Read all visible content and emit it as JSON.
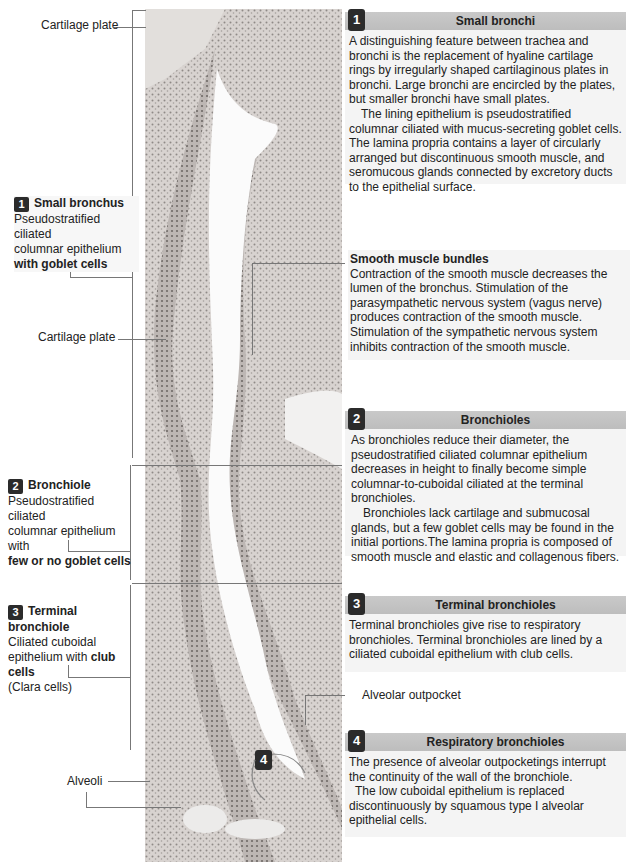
{
  "figure": {
    "left_labels": {
      "cartilage_plate_top": "Cartilage plate",
      "small_bronchus": {
        "number": "1",
        "title": "Small bronchus",
        "line1": "Pseudostratified ciliated",
        "line2": "columnar epithelium",
        "line3_bold": "with goblet cells"
      },
      "cartilage_plate_mid": "Cartilage plate",
      "bronchiole": {
        "number": "2",
        "title": "Bronchiole",
        "line1": "Pseudostratified ciliated",
        "line2": "columnar epithelium with",
        "line3_bold": "few or no goblet cells"
      },
      "terminal_bronchiole": {
        "number": "3",
        "title": "Terminal bronchiole",
        "line1": "Ciliated cuboidal",
        "line2_pre": "epithelium with ",
        "line2_bold": "club cells",
        "line3": "(Clara cells)"
      },
      "alveoli": "Alveoli"
    },
    "micrograph_badge": "4",
    "alveolar_outpocket_label": "Alveolar outpocket",
    "panels": [
      {
        "number": "1",
        "title": "Small bronchi",
        "paragraphs": [
          "A distinguishing feature between trachea and bronchi is the replacement of hyaline cartilage rings by irregularly shaped cartilaginous plates in bronchi. Large bronchi are encircled by the plates, but smaller bronchi have small plates.",
          "The lining epithelium is pseudostratified columnar ciliated with mucus-secreting goblet cells. The lamina propria contains a layer of circularly arranged but discontinuous smooth muscle, and seromucous glands connected by excretory ducts to the epithelial surface."
        ]
      },
      {
        "number": "2",
        "title": "Bronchioles",
        "paragraphs": [
          "As bronchioles reduce their diameter, the pseudostratified ciliated columnar epithelium decreases in height to finally become simple columnar-to-cuboidal ciliated at the terminal bronchioles.",
          "Bronchioles lack cartilage and submucosal glands, but a few goblet cells may be found in the initial portions.The lamina propria is composed of smooth muscle and elastic and collagenous fibers."
        ]
      },
      {
        "number": "3",
        "title": "Terminal bronchioles",
        "paragraphs": [
          "Terminal bronchioles give rise to respiratory bronchioles. Terminal bronchioles are lined by a ciliated cuboidal epithelium with club cells."
        ]
      },
      {
        "number": "4",
        "title": "Respiratory bronchioles",
        "paragraphs": [
          "The presence of alveolar outpocketings interrupt the continuity of the wall of the bronchiole.",
          "The low cuboidal epithelium is replaced discontinuously by squamous type I alveolar epithelial cells."
        ]
      }
    ],
    "smooth_muscle": {
      "title": "Smooth muscle bundles",
      "text": "Contraction of the smooth muscle decreases the lumen of the bronchus. Stimulation of the parasympathetic nervous system (vagus nerve) produces contraction of the smooth muscle. Stimulation of the sympathetic nervous system inhibits contraction of the smooth muscle."
    },
    "colors": {
      "header_bar": "#c4c4c4",
      "panel_bg": "#f4f4f4",
      "badge": "#2b2b2b",
      "tissue": "#8a8582"
    }
  }
}
